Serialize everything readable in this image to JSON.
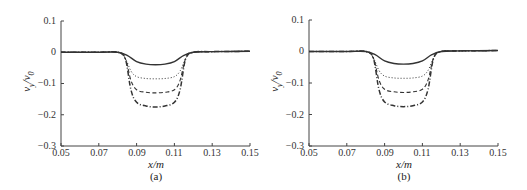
{
  "chart_data": [
    {
      "type": "line",
      "panel": "(a)",
      "xlabel": "x/m",
      "ylabel": "v_y/v_0",
      "xlim": [
        0.05,
        0.15
      ],
      "ylim": [
        -0.3,
        0.1
      ],
      "xticks": [
        "0.05",
        "0.07",
        "0.09",
        "0.11",
        "0.13",
        "0.15"
      ],
      "yticks": [
        "0.1",
        "0",
        "-0.1",
        "-0.2",
        "-0.3"
      ],
      "grid": false,
      "legend": null,
      "series": [
        {
          "name": "solid",
          "style": "solid",
          "x": [
            0.05,
            0.07,
            0.08,
            0.085,
            0.09,
            0.095,
            0.1,
            0.105,
            0.11,
            0.115,
            0.12,
            0.13,
            0.15
          ],
          "y": [
            0,
            0,
            0,
            -0.01,
            -0.03,
            -0.038,
            -0.04,
            -0.038,
            -0.03,
            -0.01,
            0,
            0.002,
            0.003
          ]
        },
        {
          "name": "dotted",
          "style": "dotted",
          "x": [
            0.05,
            0.07,
            0.08,
            0.084,
            0.087,
            0.09,
            0.095,
            0.1,
            0.105,
            0.11,
            0.113,
            0.116,
            0.12,
            0.13,
            0.15
          ],
          "y": [
            0,
            0,
            0,
            -0.02,
            -0.06,
            -0.078,
            -0.084,
            -0.085,
            -0.084,
            -0.078,
            -0.06,
            -0.02,
            0,
            0.002,
            0.003
          ]
        },
        {
          "name": "dashed",
          "style": "dashed",
          "x": [
            0.05,
            0.07,
            0.08,
            0.084,
            0.087,
            0.09,
            0.095,
            0.1,
            0.105,
            0.11,
            0.113,
            0.116,
            0.12,
            0.13,
            0.15
          ],
          "y": [
            0,
            0,
            0,
            -0.02,
            -0.09,
            -0.12,
            -0.128,
            -0.13,
            -0.128,
            -0.12,
            -0.09,
            -0.02,
            0,
            0.002,
            0.003
          ]
        },
        {
          "name": "dash-dot",
          "style": "dashdot",
          "x": [
            0.05,
            0.07,
            0.08,
            0.084,
            0.087,
            0.09,
            0.095,
            0.1,
            0.105,
            0.11,
            0.113,
            0.116,
            0.12,
            0.13,
            0.15
          ],
          "y": [
            0,
            0,
            0,
            -0.02,
            -0.12,
            -0.16,
            -0.172,
            -0.175,
            -0.172,
            -0.16,
            -0.12,
            -0.02,
            0,
            0.002,
            0.003
          ]
        }
      ]
    },
    {
      "type": "line",
      "panel": "(b)",
      "xlabel": "x/m",
      "ylabel": "v_y/v_0",
      "xlim": [
        0.05,
        0.15
      ],
      "ylim": [
        -0.3,
        0.1
      ],
      "xticks": [
        "0.05",
        "0.07",
        "0.09",
        "0.11",
        "0.13",
        "0.15"
      ],
      "yticks": [
        "0.1",
        "0",
        "-0.1",
        "-0.2",
        "-0.3"
      ],
      "grid": false,
      "legend": null,
      "series": [
        {
          "name": "solid",
          "style": "solid",
          "x": [
            0.05,
            0.07,
            0.08,
            0.085,
            0.09,
            0.095,
            0.1,
            0.105,
            0.11,
            0.115,
            0.12,
            0.13,
            0.15
          ],
          "y": [
            0,
            0,
            0,
            -0.01,
            -0.03,
            -0.038,
            -0.04,
            -0.038,
            -0.03,
            -0.01,
            0,
            0.002,
            0.003
          ]
        },
        {
          "name": "dotted",
          "style": "dotted",
          "x": [
            0.05,
            0.07,
            0.08,
            0.084,
            0.087,
            0.09,
            0.095,
            0.1,
            0.105,
            0.11,
            0.113,
            0.116,
            0.12,
            0.13,
            0.15
          ],
          "y": [
            0,
            0,
            0,
            -0.02,
            -0.06,
            -0.078,
            -0.084,
            -0.085,
            -0.084,
            -0.078,
            -0.06,
            -0.02,
            0,
            0.002,
            0.003
          ]
        },
        {
          "name": "dashed",
          "style": "dashed",
          "x": [
            0.05,
            0.07,
            0.08,
            0.084,
            0.087,
            0.09,
            0.095,
            0.1,
            0.105,
            0.11,
            0.113,
            0.116,
            0.12,
            0.13,
            0.15
          ],
          "y": [
            0,
            0,
            0,
            -0.02,
            -0.09,
            -0.12,
            -0.128,
            -0.13,
            -0.128,
            -0.12,
            -0.09,
            -0.02,
            0,
            0.002,
            0.003
          ]
        },
        {
          "name": "dash-dot",
          "style": "dashdot",
          "x": [
            0.05,
            0.07,
            0.08,
            0.084,
            0.087,
            0.09,
            0.095,
            0.1,
            0.105,
            0.11,
            0.113,
            0.116,
            0.12,
            0.13,
            0.15
          ],
          "y": [
            0,
            0,
            0,
            -0.02,
            -0.12,
            -0.16,
            -0.172,
            -0.175,
            -0.172,
            -0.16,
            -0.12,
            -0.02,
            0,
            0.002,
            0.003
          ]
        }
      ]
    }
  ],
  "panels": [
    {
      "caption": "(a)",
      "xlabel": "x/m",
      "ylabel_main": "v",
      "ylabel_sub1": "y",
      "ylabel_sep": "/v",
      "ylabel_sub2": "0",
      "xticks": [
        "0.05",
        "0.07",
        "0.09",
        "0.11",
        "0.13",
        "0.15"
      ],
      "yticks": [
        "0.1",
        "0",
        "−0.1",
        "−0.2",
        "−0.3"
      ]
    },
    {
      "caption": "(b)",
      "xlabel": "x/m",
      "ylabel_main": "v",
      "ylabel_sub1": "y",
      "ylabel_sep": "/v",
      "ylabel_sub2": "0",
      "xticks": [
        "0.05",
        "0.07",
        "0.09",
        "0.11",
        "0.13",
        "0.15"
      ],
      "yticks": [
        "0.1",
        "0",
        "−0.1",
        "−0.2",
        "−0.3"
      ]
    }
  ]
}
